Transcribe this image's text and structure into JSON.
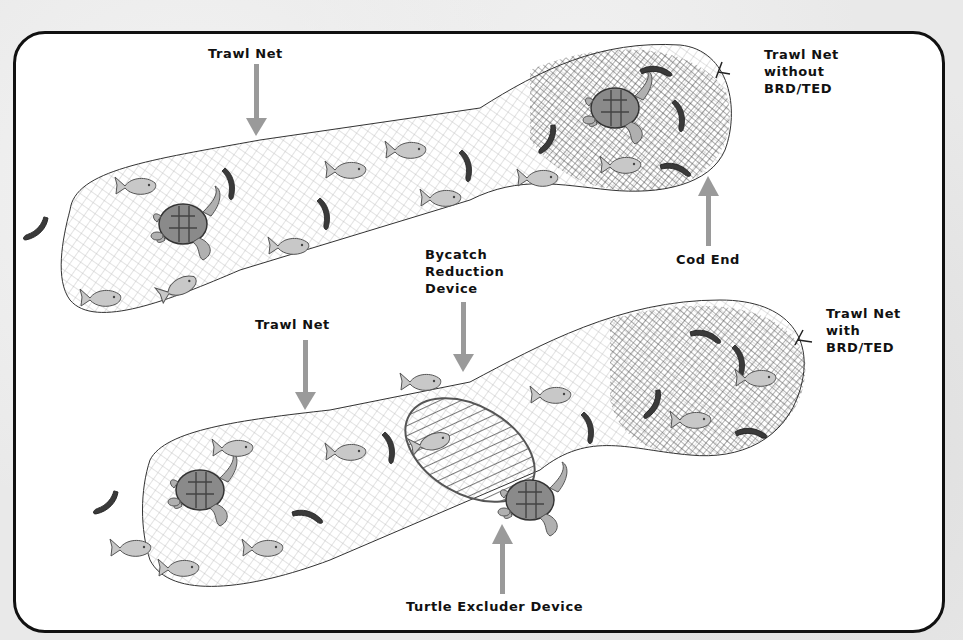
{
  "diagram": {
    "colors": {
      "border": "#111111",
      "arrow": "#9a9a9a",
      "fish_fill": "#c8c8c8",
      "turtle_shell": "#8a8a8a",
      "shrimp": "#3a3a3a",
      "net_line": "#333333"
    },
    "labels": {
      "top_trawl_net": "Trawl Net",
      "top_net_type": "Trawl Net\nwithout\nBRD/TED",
      "cod_end": "Cod End",
      "bycatch_device": "Bycatch\nReduction\nDevice",
      "bottom_trawl_net": "Trawl Net",
      "bottom_net_type": "Trawl Net\nwith\nBRD/TED",
      "turtle_excluder": "Turtle Excluder Device"
    },
    "icons": [
      "trawl-net-icon",
      "fish-icon",
      "turtle-icon",
      "shrimp-icon",
      "arrow-icon"
    ]
  }
}
